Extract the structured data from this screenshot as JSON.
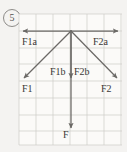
{
  "problem_number": "5",
  "figure": {
    "background_color": "#f4f3f1",
    "grid": {
      "color": "#c9c7c3",
      "cell_size_px": 17,
      "x0": 19,
      "y0": 14,
      "x1": 122,
      "y1": 145,
      "columns": 6,
      "rows": 8
    },
    "origin_point": {
      "x": 71,
      "y": 31
    },
    "vectors": [
      {
        "id": "F1a",
        "label": "F1a",
        "from": [
          71,
          31
        ],
        "to": [
          21,
          31
        ],
        "arrowhead": "end",
        "kind": "horizontal-left"
      },
      {
        "id": "F2a",
        "label": "F2a",
        "from": [
          71,
          31
        ],
        "to": [
          120,
          31
        ],
        "arrowhead": "end",
        "kind": "horizontal-right"
      },
      {
        "id": "F1",
        "label": "F1",
        "from": [
          71,
          31
        ],
        "to": [
          21,
          81
        ],
        "arrowhead": "end",
        "kind": "diagonal-down-left"
      },
      {
        "id": "F2",
        "label": "F2",
        "from": [
          71,
          31
        ],
        "to": [
          120,
          81
        ],
        "arrowhead": "end",
        "kind": "diagonal-down-right"
      },
      {
        "id": "F1b",
        "label": "F1b",
        "from": [
          71,
          31
        ],
        "to": [
          71,
          81
        ],
        "arrowhead": "end",
        "kind": "vertical-short"
      },
      {
        "id": "F2b",
        "label": "F2b",
        "from": [
          71,
          31
        ],
        "to": [
          71,
          81
        ],
        "arrowhead": "end",
        "kind": "vertical-short"
      },
      {
        "id": "F",
        "label": "F",
        "from": [
          71,
          31
        ],
        "to": [
          71,
          131
        ],
        "arrowhead": "end",
        "kind": "vertical-long"
      }
    ],
    "vector_color": "#6b6966",
    "labels": [
      {
        "name": "label-F1a",
        "text": "F1a",
        "x": 22,
        "y": 37
      },
      {
        "name": "label-F2a",
        "text": "F2a",
        "x": 93,
        "y": 37
      },
      {
        "name": "label-F1b",
        "text": "F1b",
        "x": 50,
        "y": 67
      },
      {
        "name": "label-F2b",
        "text": "F2b",
        "x": 74,
        "y": 67
      },
      {
        "name": "label-F1",
        "text": "F1",
        "x": 22,
        "y": 84
      },
      {
        "name": "label-F2",
        "text": "F2",
        "x": 101,
        "y": 84
      },
      {
        "name": "label-F",
        "text": "F",
        "x": 63,
        "y": 130
      }
    ]
  }
}
